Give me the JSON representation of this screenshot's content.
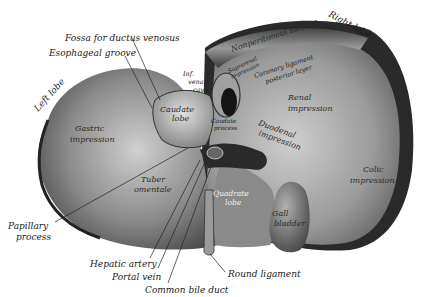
{
  "figure": {
    "colors": {
      "background": "#ffffff",
      "liver_dark": "#3a3a3a",
      "liver_mid": "#8a8a8a",
      "liver_light": "#c8c8c8",
      "ink": "#1a1a1a"
    }
  },
  "labels": {
    "external": {
      "fossa_ductus_venosus": "Fossa for ductus venosus",
      "esophageal_groove": "Esophageal groove",
      "left_lobe": "Left lobe",
      "right_lobe": "Right lobe",
      "papillary_process_line1": "Papillary",
      "papillary_process_line2": "process",
      "hepatic_artery": "Hepatic artery",
      "portal_vein": "Portal vein",
      "common_bile_duct": "Common bile duct",
      "round_ligament": "Round ligament"
    },
    "internal": {
      "nonperitoneal_surface": "Nonperitoneal surface",
      "suprarenal_line1": "Suprarenal",
      "suprarenal_line2": "impression",
      "coronary_line1": "Coronary ligament",
      "coronary_line2": "posterior layer",
      "inf_vena_cava_line1": "Inf.",
      "inf_vena_cava_line2": "vena",
      "inf_vena_cava_line3": "cava",
      "caudate_lobe_line1": "Caudate",
      "caudate_lobe_line2": "lobe",
      "caudate_process_line1": "Caudate",
      "caudate_process_line2": "process",
      "renal_line1": "Renal",
      "renal_line2": "impression",
      "duodenal_line1": "Duodenal",
      "duodenal_line2": "impression",
      "gastric_line1": "Gastric",
      "gastric_line2": "impression",
      "tuber_line1": "Tuber",
      "tuber_line2": "omentale",
      "quadrate_line1": "Quadrate",
      "quadrate_line2": "lobe",
      "gall_line1": "Gall",
      "gall_line2": "bladder",
      "colic_line1": "Colic",
      "colic_line2": "impression"
    }
  }
}
